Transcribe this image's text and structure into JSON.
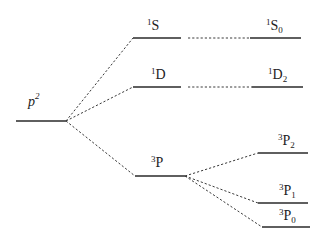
{
  "diagram": {
    "type": "energy-level-splitting",
    "configuration": {
      "label": "p",
      "superscript": "2"
    },
    "terms": [
      {
        "id": "1S",
        "sup": "1",
        "base": "S"
      },
      {
        "id": "1D",
        "sup": "1",
        "base": "D"
      },
      {
        "id": "3P",
        "sup": "3",
        "base": "P"
      }
    ],
    "levels": [
      {
        "id": "1S0",
        "sup": "1",
        "base": "S",
        "sub": "0"
      },
      {
        "id": "1D2",
        "sup": "1",
        "base": "D",
        "sub": "2"
      },
      {
        "id": "3P2",
        "sup": "3",
        "base": "P",
        "sub": "2"
      },
      {
        "id": "3P1",
        "sup": "3",
        "base": "P",
        "sub": "1"
      },
      {
        "id": "3P0",
        "sup": "3",
        "base": "P",
        "sub": "0"
      }
    ],
    "colors": {
      "line": "#2a2a2a",
      "text": "#222222",
      "background": "#ffffff"
    }
  }
}
